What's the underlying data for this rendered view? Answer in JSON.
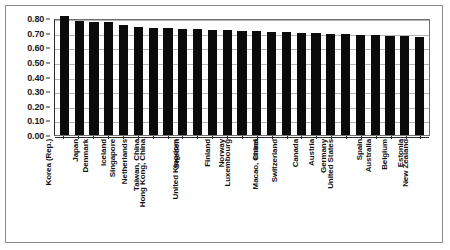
{
  "chart_data": {
    "type": "bar",
    "title": "",
    "xlabel": "",
    "ylabel": "",
    "ylim": [
      0.0,
      0.8
    ],
    "grid": true,
    "legend": "none",
    "bar_color": "#0b0b0b",
    "ytick_labels": [
      "0.80",
      "0.70",
      "0.60",
      "0.50",
      "0.40",
      "0.30",
      "0.20",
      "0.10",
      "0.00"
    ],
    "ytick_values": [
      0.8,
      0.7,
      0.6,
      0.5,
      0.4,
      0.3,
      0.2,
      0.1,
      0.0
    ],
    "categories": [
      "Korea (Rep.)",
      "Japan",
      "Denmark",
      "Iceland",
      "Singapore",
      "Netherlands",
      "Taiwan, China",
      "Hong Kong, China",
      "Sweden",
      "United Kingdom",
      "Finland",
      "Norway",
      "Luxembourg",
      "Israel",
      "Macao, China",
      "Switzerland",
      "Canada",
      "Austria",
      "Germany",
      "United States",
      "Spain",
      "Australia",
      "Belgium",
      "Estonia",
      "New Zealand"
    ],
    "values": [
      0.815,
      0.78,
      0.775,
      0.77,
      0.75,
      0.74,
      0.733,
      0.73,
      0.727,
      0.723,
      0.72,
      0.717,
      0.713,
      0.71,
      0.707,
      0.703,
      0.7,
      0.697,
      0.693,
      0.69,
      0.687,
      0.683,
      0.68,
      0.677,
      0.673
    ]
  }
}
